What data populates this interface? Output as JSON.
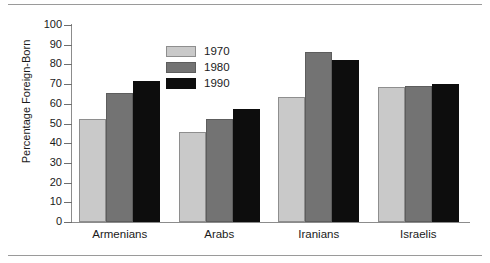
{
  "chart_data": {
    "type": "bar",
    "title": "",
    "xlabel": "",
    "ylabel": "Percentage Foreign-Born",
    "ylim": [
      0,
      100
    ],
    "ytick_labels": [
      "0",
      "10",
      "20",
      "30",
      "40",
      "50",
      "60",
      "70",
      "80",
      "90",
      "100"
    ],
    "yticks": [
      0,
      10,
      20,
      30,
      40,
      50,
      60,
      70,
      80,
      90,
      100
    ],
    "grid": false,
    "legend_position": "upper-center",
    "categories": [
      "Armenians",
      "Arabs",
      "Iranians",
      "Israelis"
    ],
    "series": [
      {
        "name": "1970",
        "color": "#c9c9c9",
        "values": [
          52.5,
          45.5,
          63.5,
          68.5
        ]
      },
      {
        "name": "1980",
        "color": "#737373",
        "values": [
          65.5,
          52.5,
          86.5,
          69.0
        ]
      },
      {
        "name": "1990",
        "color": "#0d0d0d",
        "values": [
          71.5,
          57.5,
          82.0,
          70.0
        ]
      }
    ]
  },
  "legend": {
    "entries": [
      {
        "label": "1970"
      },
      {
        "label": "1980"
      },
      {
        "label": "1990"
      }
    ]
  }
}
